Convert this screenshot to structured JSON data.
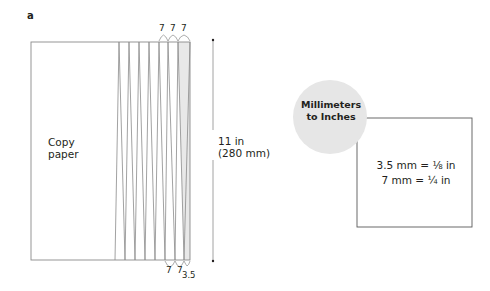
{
  "figure": {
    "panel_label": "a",
    "paper_label_line1": "Copy",
    "paper_label_line2": "paper",
    "height_label_line1": "11 in",
    "height_label_line2": "(280 mm)",
    "top_dims": [
      "7",
      "7",
      "7"
    ],
    "bottom_dims": [
      "7",
      "7",
      "3.5"
    ]
  },
  "conversion_box": {
    "title_line1": "Millimeters",
    "title_line2": "to Inches",
    "line1": "3.5 mm = ⅛ in",
    "line2": "7 mm = ¼ in"
  },
  "colors": {
    "line": "#8a8a8a",
    "text": "#231f20",
    "circle_fill": "#e6e6e6",
    "shade": "#e8e8e8"
  }
}
